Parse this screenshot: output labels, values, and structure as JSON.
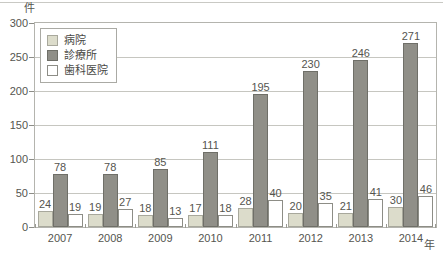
{
  "chart_data": {
    "type": "bar",
    "title": "",
    "xlabel": "年",
    "ylabel": "件",
    "ylim": [
      0,
      300
    ],
    "yticks": [
      0,
      50,
      100,
      150,
      200,
      250,
      300
    ],
    "grid": true,
    "legend_position": "top-left",
    "categories": [
      "2007",
      "2008",
      "2009",
      "2010",
      "2011",
      "2012",
      "2013",
      "2014"
    ],
    "series": [
      {
        "name": "病院",
        "color": "#dcdccb",
        "values": [
          24,
          19,
          18,
          17,
          28,
          20,
          21,
          30
        ]
      },
      {
        "name": "診療所",
        "color": "#908f88",
        "values": [
          78,
          78,
          85,
          111,
          195,
          230,
          246,
          271
        ]
      },
      {
        "name": "歯科医院",
        "color": "#ffffff",
        "values": [
          19,
          27,
          13,
          18,
          40,
          35,
          41,
          46
        ]
      }
    ]
  },
  "axes": {
    "y_unit": "件",
    "x_unit": "年"
  },
  "legend": {
    "items": [
      {
        "label": "病院"
      },
      {
        "label": "診療所"
      },
      {
        "label": "歯科医院"
      }
    ]
  },
  "colors": {
    "series_hospital": "#dcdccb",
    "series_clinic": "#908f88",
    "series_dental": "#ffffff",
    "grid": "#c6c6c0",
    "frame": "#b4b4ae",
    "text": "#55554f"
  }
}
